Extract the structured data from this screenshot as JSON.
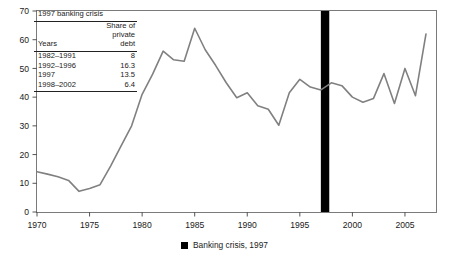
{
  "chart_data": {
    "type": "line",
    "title": "",
    "xlabel": "",
    "ylabel": "",
    "xlim": [
      1970,
      2008
    ],
    "ylim": [
      0,
      70
    ],
    "grid": false,
    "legend_position": "bottom-center",
    "series": [
      {
        "name": "Share of private debt",
        "color": "#808080",
        "x": [
          1970,
          1971,
          1972,
          1973,
          1974,
          1975,
          1976,
          1977,
          1978,
          1979,
          1980,
          1981,
          1982,
          1983,
          1984,
          1985,
          1986,
          1987,
          1988,
          1989,
          1990,
          1991,
          1992,
          1993,
          1994,
          1995,
          1996,
          1997,
          1998,
          1999,
          2000,
          2001,
          2002,
          2003,
          2004,
          2005,
          2006,
          2007
        ],
        "values": [
          14.0,
          13.2,
          12.3,
          11.0,
          7.2,
          8.2,
          9.5,
          16.0,
          23.0,
          30.0,
          41.0,
          48.0,
          56.0,
          53.0,
          52.5,
          64.0,
          56.5,
          51.0,
          45.0,
          39.8,
          41.5,
          37.0,
          35.8,
          30.2,
          41.5,
          46.2,
          43.5,
          42.5,
          45.0,
          44.0,
          40.0,
          38.2,
          39.5,
          48.2,
          37.8,
          50.0,
          40.5,
          62.0
        ]
      }
    ],
    "markers": [
      {
        "name": "banking-crisis-bar",
        "label": "Banking crisis, 1997",
        "x_start": 1997.0,
        "x_end": 1997.8,
        "color": "#000000"
      }
    ],
    "x_ticks": [
      1970,
      1975,
      1980,
      1985,
      1990,
      1995,
      2000,
      2005
    ],
    "x_tick_labels": [
      "1970",
      "1975",
      "1980",
      "1985",
      "1990",
      "1995",
      "2000",
      "2005"
    ],
    "y_ticks": [
      0,
      10,
      20,
      30,
      40,
      50,
      60,
      70
    ],
    "y_tick_labels": [
      "0",
      "10",
      "20",
      "30",
      "40",
      "50",
      "60",
      "70"
    ]
  },
  "inset": {
    "title": "1997 banking crisis",
    "header_lines": [
      "Share of",
      "private"
    ],
    "col_years_header": "Years",
    "col_value_header": "debt",
    "rows": [
      {
        "years": "1982–1991",
        "value": "8"
      },
      {
        "years": "1992–1996",
        "value": "16.3"
      },
      {
        "years": "1997",
        "value": "13.5"
      },
      {
        "years": "1998–2002",
        "value": "6.4"
      }
    ]
  },
  "legend": {
    "label": "Banking crisis, 1997",
    "swatch_color": "#000000"
  },
  "colors": {
    "line": "#808080",
    "axis": "#555555",
    "crisis_bar": "#000000",
    "text": "#1a1a1a",
    "background": "#ffffff"
  }
}
